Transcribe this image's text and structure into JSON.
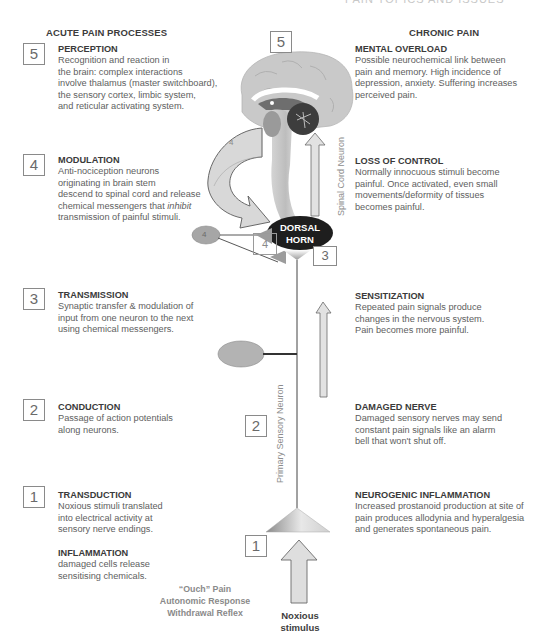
{
  "header": {
    "top_title": "PAIN TOPICS AND ISSUES",
    "left_heading": "ACUTE PAIN PROCESSES",
    "right_heading": "CHRONIC PAIN"
  },
  "acute": [
    {
      "number": "5",
      "title": "PERCEPTION",
      "text": [
        "Recognition and reaction in",
        "the brain: complex interactions",
        "involve thalamus (master switchboard),",
        "the sensory cortex, limbic system,",
        "and reticular activating system."
      ]
    },
    {
      "number": "4",
      "title": "MODULATION",
      "text": [
        "Anti-nociception neurons",
        "originating in brain stem",
        "descend to spinal cord and release",
        "chemical messengers that ",
        "transmission of painful stimuli."
      ],
      "emphasis": "inhibit"
    },
    {
      "number": "3",
      "title": "TRANSMISSION",
      "text": [
        "Synaptic transfer & modulation of",
        "input from one neuron to the next",
        "using chemical messengers."
      ]
    },
    {
      "number": "2",
      "title": "CONDUCTION",
      "text": [
        "Passage of action potentials",
        "along neurons."
      ]
    },
    {
      "number": "1",
      "title": "TRANSDUCTION",
      "text": [
        "Noxious stimuli translated",
        "into electrical activity at",
        "sensory nerve endings."
      ]
    }
  ],
  "inflammation": {
    "title": "INFLAMMATION",
    "text": [
      "damaged cells release",
      "sensitising chemicals."
    ]
  },
  "chronic": [
    {
      "title": "MENTAL OVERLOAD",
      "text": [
        "Possible neurochemical link between",
        "pain and memory. High incidence of",
        "depression, anxiety. Suffering increases",
        "perceived pain."
      ]
    },
    {
      "title": "LOSS OF CONTROL",
      "text": [
        "Normally innocuous stimuli become",
        "painful. Once activated, even small",
        "movements/deformity of tissues",
        "becomes painful."
      ]
    },
    {
      "title": "SENSITIZATION",
      "text": [
        "Repeated pain signals produce",
        "changes in the nervous system.",
        "Pain becomes more painful."
      ]
    },
    {
      "title": "DAMAGED NERVE",
      "text": [
        "Damaged sensory nerves may send",
        "constant pain signals like an alarm",
        "bell that won't shut off."
      ]
    },
    {
      "title": "NEUROGENIC INFLAMMATION",
      "text": [
        "Increased prostanoid production at site of",
        "pain produces allodynia and hyperalgesia",
        "and generates spontaneous pain."
      ]
    }
  ],
  "diagram": {
    "brain_box": "5",
    "modulation_arrow_label": "4",
    "interneuron_label": "4",
    "synapse_box_4": "4",
    "synapse_box_3": "3",
    "neuron_box_2": "2",
    "stimulus_box_1": "1",
    "dorsal_horn": [
      "DORSAL",
      "HORN"
    ],
    "spinal_cord_label": "Spinal Cord Neuron",
    "primary_neuron_label": "Primary Sensory Neuron",
    "responses": [
      "“Ouch” Pain",
      "Autonomic Response",
      "Withdrawal Reflex"
    ],
    "stimulus": [
      "Noxious",
      "stimulus"
    ],
    "colors": {
      "brain_light": "#c9c9c9",
      "brain_mid": "#8e8e8e",
      "cerebellum": "#3d3d3d",
      "dorsal_horn": "#1e1e1e",
      "arrow_fill": "#dcdcdc",
      "box_border": "#8a8a8a"
    }
  }
}
